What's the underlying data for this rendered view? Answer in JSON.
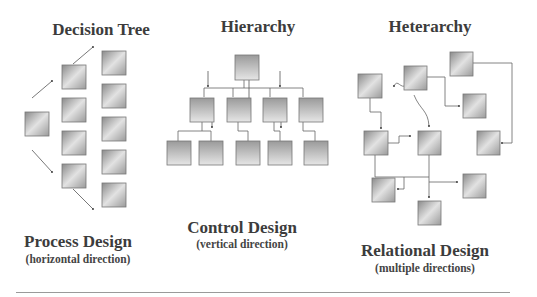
{
  "columns": [
    {
      "title": "Decision Tree",
      "design": "Process Design",
      "direction": "(horizontal direction)"
    },
    {
      "title": "Hierarchy",
      "design": "Control Design",
      "direction": "(vertical direction)"
    },
    {
      "title": "Heterarchy",
      "design": "Relational Design",
      "direction": "(multiple directions)"
    }
  ],
  "colors": {
    "box_dark": "#8c8c8c",
    "box_light": "#e4e4e4",
    "line": "#666666",
    "text": "#3c3c3c"
  }
}
